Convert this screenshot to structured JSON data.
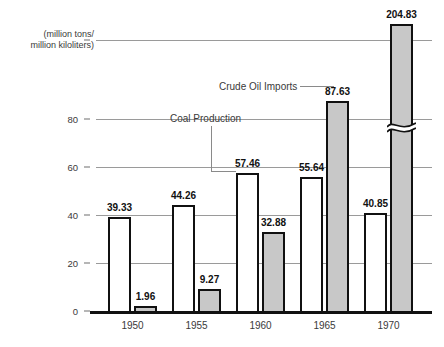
{
  "chart_data": {
    "type": "bar",
    "title": "",
    "subtitle": "",
    "xlabel": "",
    "ylabel": "(million tons/\nmillion kiloliters)",
    "categories": [
      "1950",
      "1955",
      "1960",
      "1965",
      "1970"
    ],
    "series": [
      {
        "name": "Coal Production",
        "style": "white-outlined",
        "color": "#ffffff",
        "values": [
          39.33,
          44.26,
          57.46,
          55.64,
          40.85
        ],
        "labels": [
          "39.33",
          "44.26",
          "57.46",
          "55.64",
          "40.85"
        ]
      },
      {
        "name": "Crude Oil Imports",
        "style": "gray-filled",
        "color": "#c8c8c8",
        "values": [
          1.96,
          9.27,
          32.88,
          87.63,
          204.83
        ],
        "labels": [
          "1.96",
          "9.27",
          "32.88",
          "87.63",
          "204.83"
        ]
      }
    ],
    "ylim": [
      0,
      100
    ],
    "yticks": [
      0,
      20,
      40,
      60,
      80
    ],
    "ytick_labels": [
      "0",
      "20",
      "40",
      "60",
      "80"
    ],
    "grid": true,
    "legend": "inline-annotations",
    "annotations": [
      {
        "text": "Crude Oil Imports",
        "points_to": {
          "category": "1965",
          "series": "Crude Oil Imports"
        },
        "leader": "horizontal"
      },
      {
        "text": "Coal Production",
        "points_to": {
          "category": "1960",
          "series": "Coal Production"
        },
        "leader": "elbow-down-right"
      }
    ],
    "axis_break": {
      "present": true,
      "series": "Crude Oil Imports",
      "category": "1970",
      "note": "value 204.83 exceeds plotted axis range; bar drawn with break mark"
    },
    "colors": {
      "coal_fill": "#ffffff",
      "oil_fill": "#c8c8c8",
      "outline": "#111111",
      "gridline": "#9a9a9a",
      "axis": "#111111",
      "text": "#3a3a3a"
    }
  }
}
